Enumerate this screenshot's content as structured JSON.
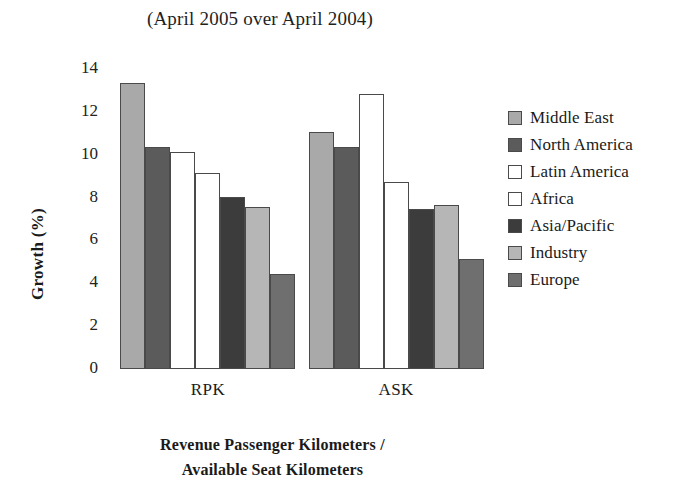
{
  "chart_data": {
    "type": "bar",
    "title": "(April 2005 over April 2004)",
    "xlabel": "Revenue Passenger Kilometers / Available Seat Kilometers",
    "xlabel_line1": "Revenue Passenger Kilometers /",
    "xlabel_line2": "Available Seat Kilometers",
    "ylabel": "Growth (%)",
    "categories": [
      "RPK",
      "ASK"
    ],
    "ylim": [
      0,
      14
    ],
    "yticks": [
      0,
      2,
      4,
      6,
      8,
      10,
      12,
      14
    ],
    "ytick_labels": [
      "0",
      "2",
      "4",
      "6",
      "8",
      "10",
      "12",
      "14"
    ],
    "grid": false,
    "legend_position": "right",
    "series": [
      {
        "name": "Middle East",
        "values": [
          13.3,
          11.0
        ],
        "color": "#a9a9a9"
      },
      {
        "name": "North America",
        "values": [
          10.3,
          10.3
        ],
        "color": "#5b5b5b"
      },
      {
        "name": "Latin America",
        "values": [
          10.1,
          12.8
        ],
        "color": "#ffffff"
      },
      {
        "name": "Africa",
        "values": [
          9.1,
          8.7
        ],
        "color": "#ffffff"
      },
      {
        "name": "Asia/Pacific",
        "values": [
          8.0,
          7.4
        ],
        "color": "#3c3c3c"
      },
      {
        "name": "Industry",
        "values": [
          7.5,
          7.6
        ],
        "color": "#b6b6b6"
      },
      {
        "name": "Europe",
        "values": [
          4.4,
          5.1
        ],
        "color": "#6f6f6f"
      }
    ]
  }
}
